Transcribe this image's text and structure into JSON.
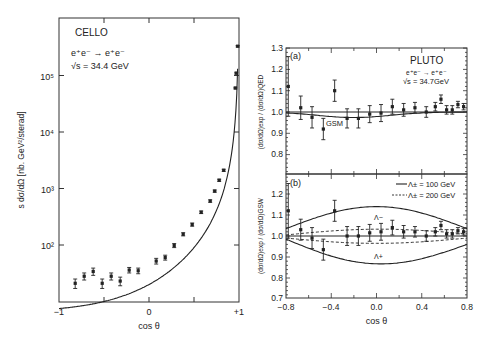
{
  "chart_data": [
    {
      "type": "scatter",
      "panel": "left",
      "title": "CELLO",
      "annotation": [
        "e⁺e⁻ → e⁺e⁻",
        "√s = 34.4 GeV"
      ],
      "xlabel": "cos θ",
      "ylabel": "s dσ/dΩ [nb. GeV²/sterad]",
      "xlim": [
        -1,
        1
      ],
      "ylim_log10": [
        1,
        5.8
      ],
      "yscale": "log",
      "xticks": [
        "−1",
        "0",
        "+1"
      ],
      "yticks": [
        "10²",
        "10³",
        "10⁴",
        "10⁵"
      ],
      "points": [
        {
          "x": -0.82,
          "y": 21,
          "err": 4
        },
        {
          "x": -0.72,
          "y": 28,
          "err": 4
        },
        {
          "x": -0.62,
          "y": 34,
          "err": 5
        },
        {
          "x": -0.52,
          "y": 21,
          "err": 4
        },
        {
          "x": -0.42,
          "y": 28,
          "err": 4
        },
        {
          "x": -0.32,
          "y": 23,
          "err": 4
        },
        {
          "x": -0.22,
          "y": 36,
          "err": 4
        },
        {
          "x": -0.12,
          "y": 35,
          "err": 4
        },
        {
          "x": 0.08,
          "y": 52,
          "err": 6
        },
        {
          "x": 0.18,
          "y": 60,
          "err": 6
        },
        {
          "x": 0.28,
          "y": 98,
          "err": 8
        },
        {
          "x": 0.38,
          "y": 155,
          "err": 10
        },
        {
          "x": 0.48,
          "y": 230,
          "err": 15
        },
        {
          "x": 0.58,
          "y": 380,
          "err": 20
        },
        {
          "x": 0.68,
          "y": 600,
          "err": 30
        },
        {
          "x": 0.73,
          "y": 900,
          "err": 40
        },
        {
          "x": 0.78,
          "y": 1400,
          "err": 60
        },
        {
          "x": 0.83,
          "y": 2100,
          "err": 90
        },
        {
          "x": 0.96,
          "y": 60000,
          "err": 2000
        },
        {
          "x": 0.97,
          "y": 110000,
          "err": 4000
        },
        {
          "x": 0.985,
          "y": 330000,
          "err": 10000
        }
      ],
      "curve": "QED fit, rising steeply toward cos θ = +1"
    },
    {
      "type": "scatter",
      "panel": "right-a",
      "label": "(a)",
      "title": "PLUTO",
      "annotation": [
        "e⁺e⁻ → e⁺e⁻",
        "√s = 34.7GeV"
      ],
      "xlabel": "",
      "ylabel": "(dσ/dΩ)exp / (dσ/dΩ)QED",
      "xlim": [
        -0.8,
        0.8
      ],
      "ylim": [
        0.7,
        1.3
      ],
      "yticks": [
        "0.8",
        "0.9",
        "1.0",
        "1.1",
        "1.2",
        "1.3"
      ],
      "curve_label": "GSM",
      "points": [
        {
          "x": -0.78,
          "y": 1.12,
          "err": 0.14
        },
        {
          "x": -0.67,
          "y": 1.02,
          "err": 0.055
        },
        {
          "x": -0.57,
          "y": 0.975,
          "err": 0.05
        },
        {
          "x": -0.47,
          "y": 0.92,
          "err": 0.05
        },
        {
          "x": -0.37,
          "y": 1.1,
          "err": 0.05
        },
        {
          "x": -0.26,
          "y": 0.97,
          "err": 0.045
        },
        {
          "x": -0.16,
          "y": 0.97,
          "err": 0.045
        },
        {
          "x": -0.06,
          "y": 0.99,
          "err": 0.04
        },
        {
          "x": 0.04,
          "y": 0.995,
          "err": 0.04
        },
        {
          "x": 0.14,
          "y": 1.025,
          "err": 0.035
        },
        {
          "x": 0.24,
          "y": 1.01,
          "err": 0.03
        },
        {
          "x": 0.34,
          "y": 1.02,
          "err": 0.025
        },
        {
          "x": 0.44,
          "y": 1.0,
          "err": 0.025
        },
        {
          "x": 0.52,
          "y": 1.025,
          "err": 0.02
        },
        {
          "x": 0.57,
          "y": 1.06,
          "err": 0.02
        },
        {
          "x": 0.62,
          "y": 1.01,
          "err": 0.02
        },
        {
          "x": 0.67,
          "y": 1.01,
          "err": 0.02
        },
        {
          "x": 0.72,
          "y": 1.035,
          "err": 0.015
        },
        {
          "x": 0.77,
          "y": 1.025,
          "err": 0.015
        }
      ]
    },
    {
      "type": "scatter",
      "panel": "right-b",
      "label": "(b)",
      "xlabel": "cos θ",
      "ylabel": "(dσ/dΩ)exp / (dσ/dΩ)GSW",
      "xlim": [
        -0.8,
        0.8
      ],
      "ylim": [
        0.7,
        1.3
      ],
      "xticks": [
        "−0.8",
        "−0.4",
        "0.0",
        "0.4",
        "0.8"
      ],
      "yticks": [
        "0.7",
        "0.8",
        "0.9",
        "1.0",
        "1.1",
        "1.2"
      ],
      "legend": [
        {
          "style": "solid",
          "label": "Λ± = 100 GeV"
        },
        {
          "style": "dashed",
          "label": "Λ± = 200 GeV"
        }
      ],
      "curve_labels": [
        "Λ−",
        "Λ+"
      ],
      "points": [
        {
          "x": -0.78,
          "y": 1.12,
          "err": 0.13
        },
        {
          "x": -0.67,
          "y": 1.03,
          "err": 0.05
        },
        {
          "x": -0.57,
          "y": 0.99,
          "err": 0.05
        },
        {
          "x": -0.47,
          "y": 0.935,
          "err": 0.05
        },
        {
          "x": -0.37,
          "y": 1.12,
          "err": 0.05
        },
        {
          "x": -0.26,
          "y": 1.0,
          "err": 0.045
        },
        {
          "x": -0.16,
          "y": 1.0,
          "err": 0.045
        },
        {
          "x": -0.06,
          "y": 1.015,
          "err": 0.04
        },
        {
          "x": 0.04,
          "y": 1.02,
          "err": 0.04
        },
        {
          "x": 0.14,
          "y": 1.04,
          "err": 0.035
        },
        {
          "x": 0.24,
          "y": 1.02,
          "err": 0.03
        },
        {
          "x": 0.34,
          "y": 1.02,
          "err": 0.025
        },
        {
          "x": 0.44,
          "y": 1.0,
          "err": 0.025
        },
        {
          "x": 0.52,
          "y": 1.02,
          "err": 0.02
        },
        {
          "x": 0.57,
          "y": 1.05,
          "err": 0.02
        },
        {
          "x": 0.62,
          "y": 1.01,
          "err": 0.02
        },
        {
          "x": 0.67,
          "y": 1.01,
          "err": 0.02
        },
        {
          "x": 0.72,
          "y": 1.025,
          "err": 0.015
        },
        {
          "x": 0.77,
          "y": 1.02,
          "err": 0.015
        }
      ]
    }
  ],
  "labels": {
    "cello": "CELLO",
    "cello_reaction": "e⁺e⁻ → e⁺e⁻",
    "cello_energy": "√s = 34.4 GeV",
    "left_xlabel": "cos θ",
    "left_ylabel": "s dσ/dΩ [nb. GeV²/sterad]",
    "left_xticks": [
      "−1",
      "0",
      "+1"
    ],
    "left_yticks": [
      "10²",
      "10³",
      "10⁴",
      "10⁵"
    ],
    "pluto": "PLUTO",
    "pluto_reaction": "e⁺e⁻ → e⁺e⁻",
    "pluto_energy": "√s = 34.7GeV",
    "panel_a": "(a)",
    "panel_b": "(b)",
    "gsm": "GSM",
    "a_ylabel": "(dσ/dΩ)exp / (dσ/dΩ)QED",
    "b_ylabel": "(dσ/dΩ)exp / (dσ/dΩ)GSW",
    "a_yticks": [
      "1.3",
      "1.2",
      "1.1",
      "1.0",
      "0.9",
      "0.8"
    ],
    "b_yticks": [
      "1.2",
      "1.1",
      "1.0",
      "0.9",
      "0.8",
      "0.7"
    ],
    "right_xticks": [
      "−0.8",
      "−0.4",
      "0.0",
      "0.4",
      "0.8"
    ],
    "right_xlabel": "cos θ",
    "legend_solid": "Λ± = 100 GeV",
    "legend_dashed": "Λ± = 200 GeV",
    "lambda_minus": "Λ−",
    "lambda_plus": "Λ+"
  }
}
